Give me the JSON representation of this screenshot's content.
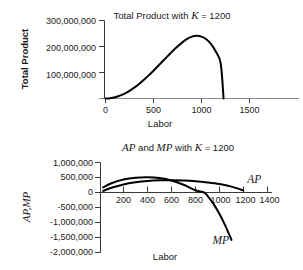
{
  "figure": {
    "background": "#ffffff",
    "curve_color": "#000000",
    "axis_color": "#3a3a3a",
    "baseline_color": "#8a8a8a"
  },
  "chart_data": [
    {
      "id": "total-product",
      "type": "line",
      "title": "Total Product with K = 1200",
      "title_parts": {
        "pre": "Total Product with ",
        "math": "K",
        "post": " = 1200"
      },
      "xlabel": "Labor",
      "ylabel": "Total Product",
      "xlim": [
        0,
        1700
      ],
      "ylim": [
        0,
        320000000
      ],
      "grid": false,
      "legend": "none",
      "xticks": [
        0,
        500,
        1000,
        1500
      ],
      "xticklabels": [
        "0",
        "500",
        "1000",
        "1500"
      ],
      "yticks": [
        100000000,
        200000000,
        300000000
      ],
      "yticklabels": [
        "100,000,000",
        "200,000,000",
        "300,000,000"
      ],
      "series": [
        {
          "name": "Total Product",
          "x": [
            0,
            50,
            100,
            150,
            200,
            250,
            300,
            350,
            400,
            450,
            500,
            550,
            600,
            650,
            700,
            750,
            800,
            850,
            900,
            950,
            1000,
            1050,
            1100,
            1150,
            1200,
            1230
          ],
          "values": [
            0,
            1300000,
            5000000,
            11000000,
            19000000,
            29500000,
            42000000,
            56000000,
            72000000,
            89000000,
            107000000,
            126000000,
            145000000,
            164000000,
            183000000,
            200000000,
            216000000,
            229000000,
            238000000,
            241000000,
            238000000,
            228000000,
            209000000,
            180000000,
            135000000,
            0
          ]
        }
      ]
    },
    {
      "id": "ap-mp",
      "type": "line",
      "title": "AP and MP with K = 1200",
      "title_parts": {
        "a": "AP",
        "mid1": " and ",
        "b": "MP",
        "mid2": " with ",
        "math": "K",
        "post": " = 1200"
      },
      "xlabel": "Labor",
      "ylabel": "AP,MP",
      "xlim": [
        0,
        1480
      ],
      "ylim": [
        -2000000,
        1000000
      ],
      "grid": false,
      "legend": "inline-annotations",
      "xticks": [
        200,
        400,
        600,
        800,
        1000,
        1200,
        1400
      ],
      "xticklabels": [
        "200",
        "400",
        "600",
        "800",
        "1000",
        "1200",
        "1400"
      ],
      "yticks": [
        1000000,
        500000,
        0,
        -500000,
        -1000000,
        -1500000,
        -2000000
      ],
      "yticklabels": [
        "1,000,000",
        "500,000",
        "0",
        "-500,000",
        "-1,000,000",
        "-1,500,000",
        "-2,000,000"
      ],
      "series": [
        {
          "name": "AP",
          "label": "AP",
          "label_x": 1290,
          "label_y": 330000,
          "x": [
            30,
            100,
            200,
            300,
            400,
            500,
            600,
            700,
            800,
            900,
            1000,
            1100,
            1200
          ],
          "values": [
            55000,
            160000,
            270000,
            340000,
            385000,
            405000,
            408000,
            398000,
            375000,
            335000,
            280000,
            195000,
            70000
          ]
        },
        {
          "name": "MP",
          "label": "MP",
          "label_x": 1010,
          "label_y": -1720000,
          "x": [
            30,
            100,
            200,
            300,
            400,
            500,
            600,
            700,
            800,
            870,
            900,
            950,
            1000,
            1050,
            1100
          ],
          "values": [
            170000,
            310000,
            430000,
            490000,
            505000,
            480000,
            400000,
            260000,
            75000,
            0,
            -110000,
            -380000,
            -720000,
            -1120000,
            -1580000
          ]
        }
      ]
    }
  ]
}
